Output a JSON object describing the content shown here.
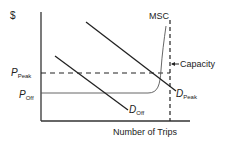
{
  "diagram": {
    "y_axis_label": "$",
    "x_axis_label": "Number of Trips",
    "price_peak": {
      "main": "P",
      "sub": "Peak"
    },
    "price_off": {
      "main": "P",
      "sub": "Off"
    },
    "msc_label": "MSC",
    "capacity_label": "Capacity",
    "demand_peak": {
      "main": "D",
      "sub": "Peak"
    },
    "demand_off": {
      "main": "D",
      "sub": "Off"
    },
    "colors": {
      "line": "#222222",
      "thin_curve": "#555555"
    }
  }
}
